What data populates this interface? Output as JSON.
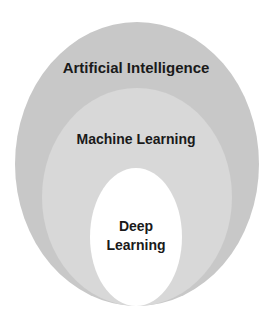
{
  "diagram": {
    "type": "nested-sets",
    "sets": [
      {
        "label": "Artificial Intelligence",
        "fill": "#c8c8c8",
        "stroke": "#bdbdbd"
      },
      {
        "label": "Machine Learning",
        "fill": "#d8d8d8",
        "stroke": "#c4c4c4"
      },
      {
        "label_line1": "Deep",
        "label_line2": "Learning",
        "fill": "#ffffff",
        "stroke": "#cccccc"
      }
    ]
  }
}
